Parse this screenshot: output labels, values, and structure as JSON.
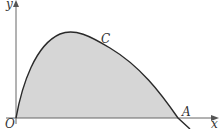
{
  "diagram": {
    "type": "function-graph",
    "labels": {
      "y_axis": "y",
      "x_axis": "x",
      "origin": "O",
      "curve": "C",
      "intersection": "A"
    },
    "colors": {
      "fill": "#d4d4d4",
      "curve": "#2a2a2a",
      "axis": "#555555"
    }
  }
}
